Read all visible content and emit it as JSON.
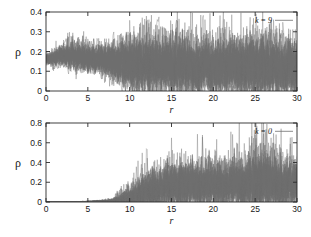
{
  "figure": {
    "title": "",
    "background_color": "#ffffff",
    "trace_color": "#6e6e6e",
    "axis_color": "#2b2b2b",
    "panel_count": 2
  },
  "panels": {
    "top": {
      "name": "top-panel",
      "legend_label": "k = 9",
      "ylabel": "ρ",
      "xlabel": "r",
      "ytick_labels": [
        "0",
        "0.1",
        "0.2",
        "0.3",
        "0.4"
      ],
      "xtick_labels": [
        "0",
        "5",
        "10",
        "15",
        "20",
        "25",
        "30"
      ]
    },
    "bottom": {
      "name": "bottom-panel",
      "legend_label": "k = 0",
      "ylabel": "ρ",
      "xlabel": "r",
      "ytick_labels": [
        "0",
        "0.2",
        "0.4",
        "0.6",
        "0.8"
      ],
      "xtick_labels": [
        "0",
        "5",
        "10",
        "15",
        "20",
        "25",
        "30"
      ]
    }
  },
  "chart_data": [
    {
      "type": "line",
      "name": "top-panel",
      "title": "",
      "xlabel": "r",
      "ylabel": "ρ",
      "legend": [
        "k = 9"
      ],
      "legend_position": "top-right",
      "grid": false,
      "xlim": [
        0,
        30
      ],
      "ylim": [
        0,
        0.4
      ],
      "xticks": [
        0,
        5,
        10,
        15,
        20,
        25,
        30
      ],
      "yticks": [
        0,
        0.1,
        0.2,
        0.3,
        0.4
      ],
      "n_series": 40,
      "description": "Many overlapping noisy traces of rho versus r. All traces begin near rho = 0.13-0.20 at r = 0, stay tightly bunched around 0.15-0.20 for r < 5, then progressively spread downward and become strongly oscillatory; from r = 10 onward the envelope fills the band from 0 to about 0.35 with a dense core between 0.02 and 0.20. Occasional spikes reach 0.30-0.35 near r = 12, 16.5, 21 and 26.5.",
      "envelope": {
        "x": [
          0,
          2,
          4,
          6,
          8,
          10,
          12,
          14,
          16,
          18,
          20,
          22,
          24,
          26,
          28,
          30
        ],
        "mean": [
          0.16,
          0.175,
          0.17,
          0.16,
          0.15,
          0.135,
          0.13,
          0.125,
          0.125,
          0.12,
          0.12,
          0.12,
          0.12,
          0.12,
          0.12,
          0.12
        ],
        "upper": [
          0.19,
          0.25,
          0.27,
          0.24,
          0.26,
          0.28,
          0.32,
          0.3,
          0.34,
          0.3,
          0.31,
          0.3,
          0.31,
          0.35,
          0.31,
          0.3
        ],
        "lower": [
          0.13,
          0.13,
          0.12,
          0.09,
          0.05,
          0.01,
          0.0,
          0.0,
          0.0,
          0.0,
          0.0,
          0.0,
          0.0,
          0.0,
          0.0,
          0.0
        ]
      }
    },
    {
      "type": "line",
      "name": "bottom-panel",
      "title": "",
      "xlabel": "r",
      "ylabel": "ρ",
      "legend": [
        "k = 0"
      ],
      "legend_position": "top-right",
      "grid": false,
      "xlim": [
        0,
        30
      ],
      "ylim": [
        0,
        0.8
      ],
      "xticks": [
        0,
        5,
        10,
        15,
        20,
        25,
        30
      ],
      "yticks": [
        0,
        0.2,
        0.4,
        0.6,
        0.8
      ],
      "n_series": 40,
      "description": "Many overlapping noisy traces of rho versus r. All traces are essentially flat at rho = 0 for r < 8, begin to lift around r = 9-11, and grow into a dense oscillatory band for r > 13 whose core lies between 0 and 0.25 with frequent spikes to 0.35-0.55. The tallest excursions reach about 0.70 near r = 27 and about 0.60 near r = 17 and r = 24.",
      "envelope": {
        "x": [
          0,
          2,
          4,
          6,
          8,
          10,
          12,
          14,
          16,
          18,
          20,
          22,
          24,
          26,
          28,
          30
        ],
        "mean": [
          0.0,
          0.0,
          0.0,
          0.005,
          0.01,
          0.04,
          0.1,
          0.14,
          0.16,
          0.16,
          0.17,
          0.17,
          0.17,
          0.18,
          0.17,
          0.17
        ],
        "upper": [
          0.005,
          0.005,
          0.01,
          0.02,
          0.06,
          0.22,
          0.4,
          0.45,
          0.58,
          0.48,
          0.5,
          0.52,
          0.6,
          0.7,
          0.55,
          0.52
        ],
        "lower": [
          0.0,
          0.0,
          0.0,
          0.0,
          0.0,
          0.0,
          0.0,
          0.0,
          0.0,
          0.0,
          0.0,
          0.0,
          0.0,
          0.0,
          0.0,
          0.0
        ]
      }
    }
  ]
}
